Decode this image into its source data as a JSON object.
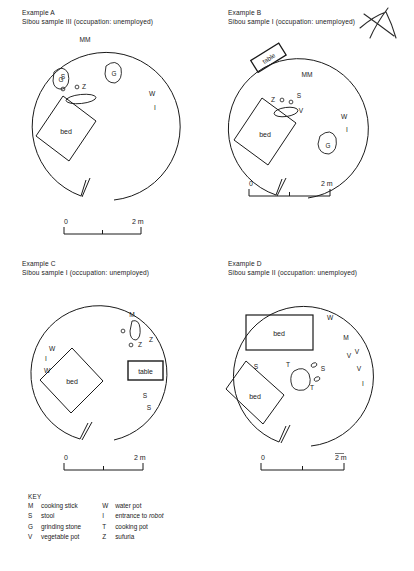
{
  "figure": {
    "panels": [
      {
        "id": "A",
        "heading_line1": "Example A",
        "heading_line2": "Sibou sample III (occupation: unemployed)",
        "furniture": [
          {
            "type": "bed",
            "label": "bed"
          }
        ],
        "item_labels": [
          "MM",
          "G",
          "G",
          "S",
          "o",
          "o",
          "Z",
          "W",
          "I"
        ],
        "scale": {
          "left_label": "0",
          "right_label": "2 m"
        }
      },
      {
        "id": "B",
        "heading_line1": "Example B",
        "heading_line2": "Sibou sample I (occupation: unemployed)",
        "furniture": [
          {
            "type": "table",
            "label": "table"
          },
          {
            "type": "bed",
            "label": "bed"
          }
        ],
        "item_labels": [
          "MM",
          "Z",
          "o",
          "o",
          "S",
          "V",
          "W",
          "I",
          "G"
        ],
        "scale": {
          "left_label": "0",
          "right_label": "2 m"
        }
      },
      {
        "id": "C",
        "heading_line1": "Example C",
        "heading_line2": "Sibou sample I (occupation: unemployed)",
        "furniture": [
          {
            "type": "table",
            "label": "table"
          },
          {
            "type": "bed",
            "label": "bed"
          }
        ],
        "item_labels": [
          "M",
          "o",
          "o",
          "Z",
          "Z",
          "W",
          "I",
          "W",
          "S",
          "S"
        ],
        "scale": {
          "left_label": "0",
          "right_label": "2 m"
        }
      },
      {
        "id": "D",
        "heading_line1": "Example D",
        "heading_line2": "Sibou sample II (occupation: unemployed)",
        "furniture": [
          {
            "type": "bed",
            "label": "bed"
          },
          {
            "type": "bed",
            "label": "bed"
          }
        ],
        "item_labels": [
          "W",
          "M",
          "V",
          "V",
          "V",
          "I",
          "S",
          "T",
          "o",
          "S",
          "o",
          "T"
        ],
        "scale": {
          "left_label": "0",
          "right_label": "2 m"
        }
      }
    ],
    "key": {
      "title": "KEY",
      "columns": [
        [
          {
            "symbol": "M",
            "label": "cooking stick"
          },
          {
            "symbol": "S",
            "label": "stool"
          },
          {
            "symbol": "G",
            "label": "grinding stone"
          },
          {
            "symbol": "V",
            "label": "vegetable pot"
          }
        ],
        [
          {
            "symbol": "W",
            "label": "water pot"
          },
          {
            "symbol": "I",
            "label": "entrance to ",
            "label_italic": "robot"
          },
          {
            "symbol": "T",
            "label": "cooking pot"
          },
          {
            "symbol": "Z",
            "label": "sufuria"
          }
        ]
      ]
    },
    "colors": {
      "ink": "#1a1a1a",
      "paper": "#ffffff"
    }
  }
}
